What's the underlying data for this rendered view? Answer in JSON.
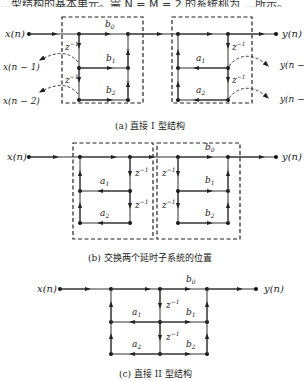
{
  "top_text": "…型结构的基本单元。需 N = M = 2 的系统称为 …所示。",
  "figure_a": {
    "caption": "(a) 直接 I 型结构",
    "input": "x(n)",
    "output": "y(n)",
    "delayed_inputs": [
      "x(n − 1)",
      "x(n − 2)"
    ],
    "delayed_outputs": [
      "y(n − 1",
      "y(n − 2"
    ],
    "coefficients_b": [
      "b0",
      "b1",
      "b2"
    ],
    "coefficients_a": [
      "a1",
      "a2"
    ],
    "delay": "z",
    "delay_exp": "−1"
  },
  "figure_b": {
    "caption": "(b) 交换两个延时子系统的位置",
    "input": "x(n)",
    "output": "y(n)",
    "coefficients_b": [
      "b0",
      "b1",
      "b2"
    ],
    "coefficients_a": [
      "a1",
      "a2"
    ],
    "delay": "z",
    "delay_exp": "−1"
  },
  "figure_c": {
    "caption": "(c) 直接 II 型结构",
    "input": "x(n)",
    "output": "y(n)",
    "coefficients_b": [
      "b0",
      "b1",
      "b2"
    ],
    "coefficients_a": [
      "a1",
      "a2"
    ],
    "delay": "z",
    "delay_exp": "−1"
  },
  "colors": {
    "line": "#333333",
    "node": "#111111",
    "background": "#ffffff"
  }
}
